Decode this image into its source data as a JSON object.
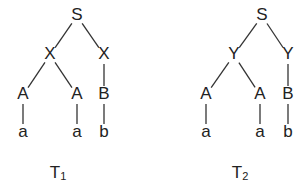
{
  "trees": [
    {
      "id": "T1",
      "caption": {
        "main": "T",
        "sub": "1",
        "x": 58,
        "y": 174
      },
      "nodes": [
        {
          "label": "S",
          "x": 77,
          "y": 16
        },
        {
          "label": "X",
          "x": 50,
          "y": 55
        },
        {
          "label": "X",
          "x": 104,
          "y": 55
        },
        {
          "label": "A",
          "x": 23,
          "y": 95
        },
        {
          "label": "A",
          "x": 77,
          "y": 95
        },
        {
          "label": "B",
          "x": 104,
          "y": 95
        },
        {
          "label": "a",
          "x": 23,
          "y": 133
        },
        {
          "label": "a",
          "x": 77,
          "y": 133
        },
        {
          "label": "b",
          "x": 104,
          "y": 133
        }
      ],
      "edges": [
        [
          0,
          1
        ],
        [
          0,
          2
        ],
        [
          1,
          3
        ],
        [
          1,
          4
        ],
        [
          2,
          5
        ],
        [
          3,
          6
        ],
        [
          4,
          7
        ],
        [
          5,
          8
        ]
      ]
    },
    {
      "id": "T2",
      "caption": {
        "main": "T",
        "sub": "2",
        "x": 240,
        "y": 174
      },
      "nodes": [
        {
          "label": "S",
          "x": 262,
          "y": 16
        },
        {
          "label": "Y",
          "x": 234,
          "y": 55
        },
        {
          "label": "Y",
          "x": 288,
          "y": 55
        },
        {
          "label": "A",
          "x": 206,
          "y": 95
        },
        {
          "label": "A",
          "x": 260,
          "y": 95
        },
        {
          "label": "B",
          "x": 288,
          "y": 95
        },
        {
          "label": "a",
          "x": 206,
          "y": 133
        },
        {
          "label": "a",
          "x": 260,
          "y": 133
        },
        {
          "label": "b",
          "x": 288,
          "y": 133
        }
      ],
      "edges": [
        [
          0,
          1
        ],
        [
          0,
          2
        ],
        [
          1,
          3
        ],
        [
          1,
          4
        ],
        [
          2,
          5
        ],
        [
          3,
          6
        ],
        [
          4,
          7
        ],
        [
          5,
          8
        ]
      ]
    }
  ]
}
